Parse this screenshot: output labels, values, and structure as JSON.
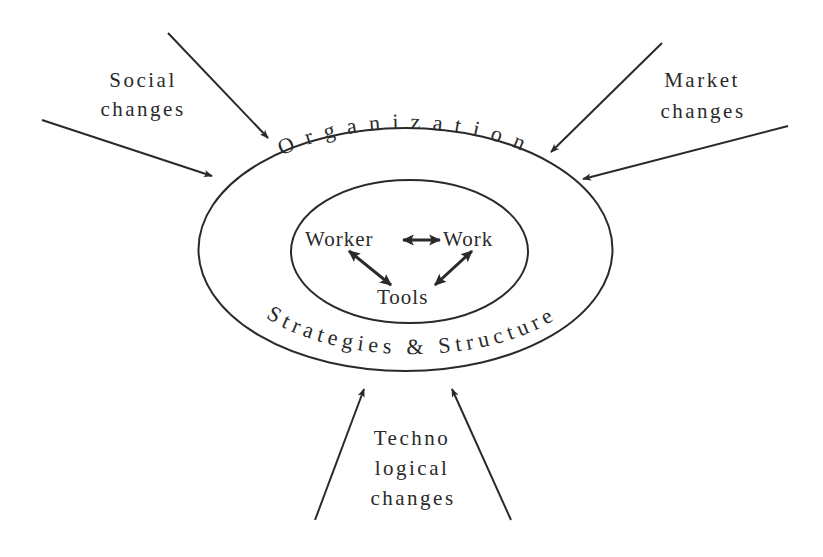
{
  "diagram": {
    "colors": {
      "stroke": "#2a2a2a",
      "background": "#ffffff"
    },
    "outer_ring": {
      "top_label": "Organization",
      "bottom_label": "Strategies & Structure"
    },
    "inner_ring": {
      "nodes": {
        "worker": "Worker",
        "work": "Work",
        "tools": "Tools"
      },
      "links": [
        {
          "from": "Worker",
          "to": "Work",
          "type": "bidirectional"
        },
        {
          "from": "Worker",
          "to": "Tools",
          "type": "bidirectional"
        },
        {
          "from": "Work",
          "to": "Tools",
          "type": "bidirectional"
        }
      ]
    },
    "external_forces": {
      "social": {
        "line1": "Social",
        "line2": "changes",
        "arrow_count": 2
      },
      "market": {
        "line1": "Market",
        "line2": "changes",
        "arrow_count": 2
      },
      "technological": {
        "line1": "Techno",
        "line2": "logical",
        "line3": "changes",
        "arrow_count": 2
      }
    }
  }
}
